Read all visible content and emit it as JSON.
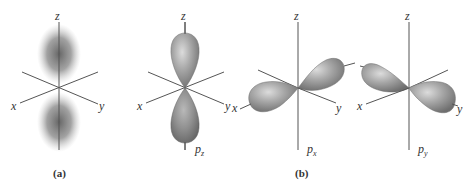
{
  "figure": {
    "panel_a": {
      "label": "(a)",
      "description": "electron density cloud (p orbital)",
      "axes": {
        "z": "z",
        "x": "x",
        "y": "y"
      }
    },
    "panel_b": {
      "label": "(b)",
      "orbitals": [
        {
          "name": "p",
          "sub": "z",
          "axes": {
            "z": "z",
            "x": "x",
            "y": "y"
          }
        },
        {
          "name": "p",
          "sub": "x",
          "axes": {
            "z": "z",
            "x": "x",
            "y": "y"
          }
        },
        {
          "name": "p",
          "sub": "y",
          "axes": {
            "z": "z",
            "x": "x",
            "y": "y"
          }
        }
      ]
    },
    "colors": {
      "lobe_fill": "#8f8f8f",
      "lobe_highlight": "#d6d6d6",
      "cloud": "#6a6a6a",
      "axis": "#555555"
    }
  }
}
